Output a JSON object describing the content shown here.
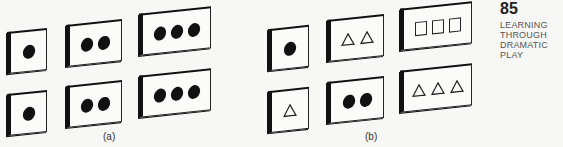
{
  "page": {
    "number": "85",
    "section_title": "LEARNING\nTHROUGH\nDRAMATIC PLAY"
  },
  "figures": [
    {
      "caption": "(a)",
      "rows": [
        [
          {
            "shape": "dot",
            "count": 1
          },
          {
            "shape": "dot",
            "count": 2
          },
          {
            "shape": "dot",
            "count": 3
          }
        ],
        [
          {
            "shape": "dot",
            "count": 1
          },
          {
            "shape": "dot",
            "count": 2
          },
          {
            "shape": "dot",
            "count": 3
          }
        ]
      ]
    },
    {
      "caption": "(b)",
      "rows": [
        [
          {
            "shape": "dot",
            "count": 1
          },
          {
            "shape": "triangle",
            "count": 2
          },
          {
            "shape": "square",
            "count": 3
          }
        ],
        [
          {
            "shape": "triangle",
            "count": 1
          },
          {
            "shape": "dot",
            "count": 2
          },
          {
            "shape": "triangle",
            "count": 3
          }
        ]
      ]
    }
  ],
  "colors": {
    "ink": "#111111",
    "paper": "#f7f7f5"
  }
}
